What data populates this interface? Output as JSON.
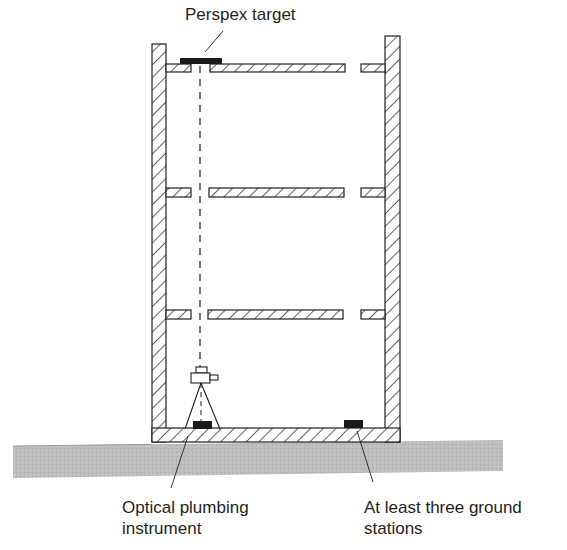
{
  "figure": {
    "type": "building-section-diagram"
  },
  "labels": {
    "perspex_target": "Perspex target",
    "instrument_line1": "Optical plumbing",
    "instrument_line2": "instrument",
    "stations_line1": "At least three ground",
    "stations_line2": "stations"
  },
  "components": {
    "floors_above_ground": 3,
    "walls": 2,
    "ground_stations_shown": 2
  },
  "colors": {
    "line": "#231f20",
    "ground_fill": "#b9b9b9",
    "block_fill": "#1a1a1a",
    "background": "#ffffff"
  }
}
